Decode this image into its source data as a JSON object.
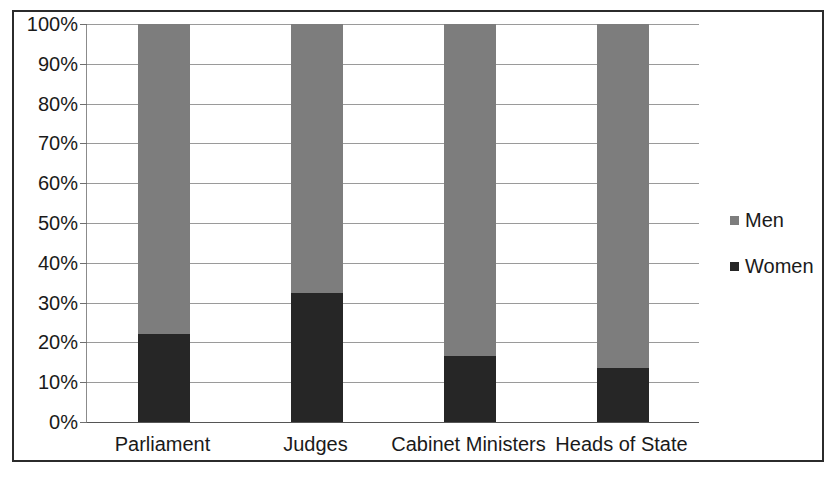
{
  "chart_data": {
    "type": "bar",
    "subtype": "stacked-100-percent",
    "title": "",
    "subtitle": "",
    "xlabel": "",
    "ylabel": "",
    "categories": [
      "Parliament",
      "Judges",
      "Cabinet Ministers",
      "Heads of State"
    ],
    "series": [
      {
        "name": "Women",
        "values": [
          22,
          32.5,
          16.5,
          13.5
        ],
        "color": "#262626"
      },
      {
        "name": "Men",
        "values": [
          78,
          67.5,
          83.5,
          86.5
        ],
        "color": "#7d7d7d"
      }
    ],
    "stack_order": [
      "Women",
      "Men"
    ],
    "ylim": [
      0,
      100
    ],
    "ytick_values": [
      0,
      10,
      20,
      30,
      40,
      50,
      60,
      70,
      80,
      90,
      100
    ],
    "ytick_labels": [
      "0%",
      "10%",
      "20%",
      "30%",
      "40%",
      "50%",
      "60%",
      "70%",
      "80%",
      "90%",
      "100%"
    ],
    "grid": true,
    "grid_axis": "y",
    "legend_position": "right",
    "legend_entries": [
      {
        "label": "Men",
        "color": "#7d7d7d",
        "marker": "square"
      },
      {
        "label": "Women",
        "color": "#262626",
        "marker": "square"
      }
    ],
    "colors": {
      "men": "#7d7d7d",
      "women": "#262626",
      "gridline": "#9a9a9a",
      "axis": "#555555",
      "frame": "#2b2b2b",
      "text": "#1a1a1a",
      "background": "#ffffff"
    }
  }
}
